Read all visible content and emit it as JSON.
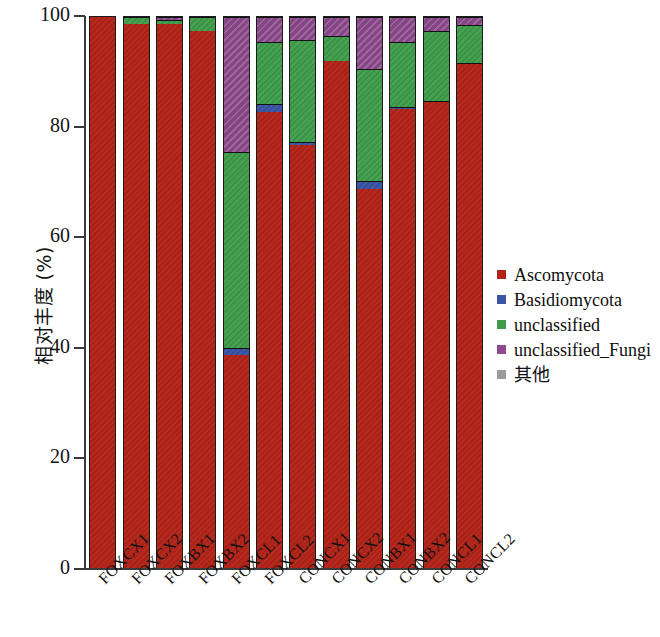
{
  "chart_data": {
    "type": "bar",
    "stacked": true,
    "stack_mode": "percent",
    "title": "",
    "xlabel": "",
    "ylabel": "相对丰度 (%)",
    "ylim": [
      0,
      100
    ],
    "yticks": [
      0,
      20,
      40,
      60,
      80,
      100
    ],
    "ytick_labels": [
      "0",
      "20",
      "40",
      "60",
      "80",
      "100"
    ],
    "grid": false,
    "legend_position": "right",
    "categories": [
      "FOXCX1",
      "FOXCX2",
      "FOXBX1",
      "FOXBX2",
      "FOXCL1",
      "FOXCL2",
      "CONCX1",
      "CONCX2",
      "CONBX1",
      "CONBX2",
      "CONCL1",
      "CONCL2"
    ],
    "series": [
      {
        "name": "Ascomycota",
        "color": "#b32318",
        "values": [
          100.0,
          98.8,
          98.8,
          97.5,
          38.6,
          82.8,
          76.8,
          92.0,
          68.8,
          83.3,
          84.5,
          91.5
        ]
      },
      {
        "name": "Basidiomycota",
        "color": "#3a55a6",
        "values": [
          0.0,
          0.0,
          0.0,
          0.0,
          1.4,
          1.4,
          0.5,
          0.0,
          1.4,
          0.4,
          0.3,
          0.2
        ]
      },
      {
        "name": "unclassified",
        "color": "#3f9d4a",
        "values": [
          0.0,
          1.2,
          0.7,
          2.5,
          35.5,
          11.3,
          18.5,
          4.5,
          20.3,
          11.8,
          12.7,
          6.8
        ]
      },
      {
        "name": "unclassified_Fungi",
        "color": "#8e4a8e",
        "values": [
          0.0,
          0.0,
          0.5,
          0.0,
          24.5,
          4.5,
          4.2,
          3.5,
          9.5,
          4.5,
          2.5,
          1.5
        ]
      },
      {
        "name": "其他",
        "color": "#9b9b9b",
        "values": [
          0.0,
          0.0,
          0.0,
          0.0,
          0.0,
          0.0,
          0.0,
          0.0,
          0.0,
          0.0,
          0.0,
          0.0
        ]
      }
    ]
  },
  "legend": {
    "entries": [
      {
        "label": "Ascomycota",
        "color": "#b32318"
      },
      {
        "label": "Basidiomycota",
        "color": "#3a55a6"
      },
      {
        "label": "unclassified",
        "color": "#3f9d4a"
      },
      {
        "label": "unclassified_Fungi",
        "color": "#8e4a8e"
      },
      {
        "label": "其他",
        "color": "#9b9b9b"
      }
    ]
  }
}
